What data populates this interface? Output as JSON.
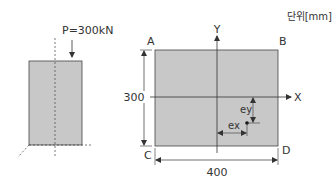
{
  "unit_label": "단위[mm]",
  "load_label": "P=300kN",
  "corners": {
    "a": "A",
    "b": "B",
    "c": "C",
    "d": "D"
  },
  "axes": {
    "x": "X",
    "y": "Y"
  },
  "dimensions": {
    "height": "300",
    "width": "400"
  },
  "eccentricity": {
    "ex": "ex",
    "ey": "ey"
  },
  "colors": {
    "fill": "#c8c8c8",
    "stroke": "#333333"
  }
}
